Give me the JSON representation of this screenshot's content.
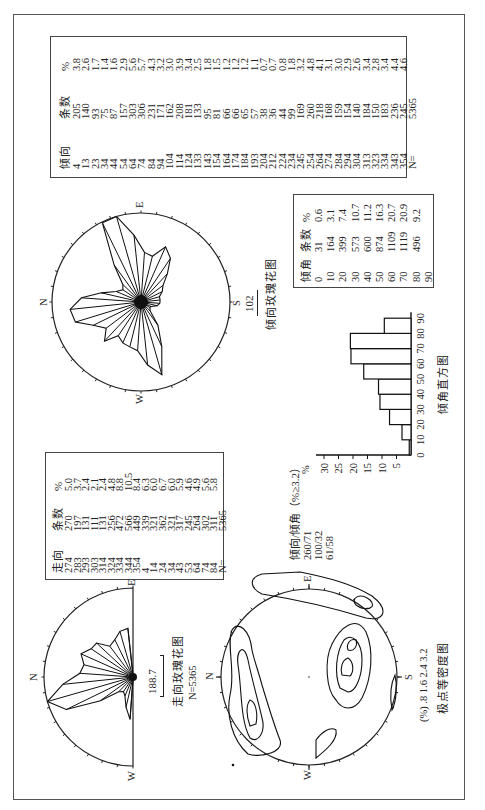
{
  "figure": {
    "dip_table": {
      "headers": [
        "倾向",
        "条数",
        "%"
      ],
      "dip_direction": [
        "4",
        "13",
        "23",
        "34",
        "44",
        "54",
        "64",
        "74",
        "84",
        "94",
        "104",
        "114",
        "124",
        "133",
        "143",
        "154",
        "164",
        "174",
        "184",
        "193",
        "204",
        "212",
        "224",
        "234",
        "245",
        "254",
        "264",
        "274",
        "284",
        "294",
        "304",
        "313",
        "323",
        "334",
        "343",
        "354",
        "N="
      ],
      "count": [
        "205",
        "140",
        "93",
        "75",
        "87",
        "157",
        "303",
        "306",
        "231",
        "171",
        "162",
        "208",
        "181",
        "133",
        "95",
        "81",
        "66",
        "66",
        "65",
        "57",
        "38",
        "36",
        "44",
        "99",
        "169",
        "260",
        "218",
        "168",
        "159",
        "154",
        "140",
        "184",
        "150",
        "183",
        "236",
        "245",
        "5365"
      ],
      "percent": [
        "3.8",
        "2.6",
        "1.7",
        "1.4",
        "1.6",
        "2.9",
        "5.6",
        "5.7",
        "4.3",
        "3.2",
        "3.0",
        "3.9",
        "3.4",
        "2.5",
        "1.8",
        "1.5",
        "1.2",
        "1.2",
        "1.2",
        "1.1",
        "0.7",
        "0.7",
        "0.8",
        "1.8",
        "3.2",
        "4.8",
        "4.1",
        "3.1",
        "3.0",
        "2.9",
        "2.6",
        "3.4",
        "2.8",
        "3.4",
        "4.4",
        "4.6"
      ]
    },
    "strike_table": {
      "headers": [
        "走向",
        "条数",
        "%"
      ],
      "strike": [
        "274",
        "283",
        "293",
        "303",
        "314",
        "324",
        "334",
        "344",
        "354",
        "4",
        "14",
        "24",
        "34",
        "43",
        "53",
        "64",
        "74",
        "84",
        "N="
      ],
      "count": [
        "270",
        "197",
        "131",
        "111",
        "131",
        "256",
        "472",
        "566",
        "449",
        "339",
        "321",
        "362",
        "321",
        "317",
        "245",
        "264",
        "302",
        "311",
        "5365"
      ],
      "percent": [
        "5.0",
        "3.7",
        "2.4",
        "2.1",
        "2.4",
        "4.8",
        "8.8",
        "10.5",
        "8.4",
        "6.3",
        "6.0",
        "6.7",
        "6.0",
        "5.9",
        "4.6",
        "4.9",
        "5.6",
        "5.8"
      ]
    },
    "dip_angle_table": {
      "headers": [
        "倾角",
        "条数",
        "%"
      ],
      "dip_angle": [
        "0",
        "10",
        "20",
        "30",
        "40",
        "50",
        "60",
        "70",
        "80",
        "90"
      ],
      "count": [
        "31",
        "164",
        "399",
        "573",
        "600",
        "874",
        "1109",
        "1119",
        "496"
      ],
      "percent": [
        "0.6",
        "3.1",
        "7.4",
        "10.7",
        "11.2",
        "16.3",
        "20.7",
        "20.9",
        "9.2"
      ]
    },
    "strike_rose": {
      "labels": {
        "n": "N",
        "e": "E",
        "w": "W"
      },
      "scale_value": "188.7",
      "caption": "走向玫瑰花图",
      "n_label": "N=5365"
    },
    "dip_rose": {
      "labels": {
        "n": "N",
        "e": "E",
        "s": "S",
        "w": "W"
      },
      "scale_value": "102",
      "caption": "倾向玫瑰花图"
    },
    "contour": {
      "labels": {
        "n": "N",
        "e": "E",
        "s": "S",
        "w": "W"
      },
      "title": "倾向/倾角（%≥3.2）",
      "maxima": [
        "260/71",
        "100/32",
        "61/58"
      ],
      "legend": "(%) .8 1.6 2.4 3.2",
      "caption": "极点等密度图"
    },
    "histogram": {
      "ylabel": "%",
      "yticks": [
        "5",
        "10",
        "15",
        "20",
        "25",
        "30"
      ],
      "xticks": [
        "0",
        "10",
        "20",
        "30",
        "40",
        "50",
        "60",
        "70",
        "80",
        "90"
      ],
      "caption": "倾角直方图"
    }
  },
  "chart_data": [
    {
      "type": "table",
      "title": "倾向统计",
      "columns": [
        "倾向",
        "条数",
        "%"
      ],
      "rows": [
        [
          4,
          205,
          3.8
        ],
        [
          13,
          140,
          2.6
        ],
        [
          23,
          93,
          1.7
        ],
        [
          34,
          75,
          1.4
        ],
        [
          44,
          87,
          1.6
        ],
        [
          54,
          157,
          2.9
        ],
        [
          64,
          303,
          5.6
        ],
        [
          74,
          306,
          5.7
        ],
        [
          84,
          231,
          4.3
        ],
        [
          94,
          171,
          3.2
        ],
        [
          104,
          162,
          3.0
        ],
        [
          114,
          208,
          3.9
        ],
        [
          124,
          181,
          3.4
        ],
        [
          133,
          133,
          2.5
        ],
        [
          143,
          95,
          1.8
        ],
        [
          154,
          81,
          1.5
        ],
        [
          164,
          66,
          1.2
        ],
        [
          174,
          66,
          1.2
        ],
        [
          184,
          65,
          1.2
        ],
        [
          193,
          57,
          1.1
        ],
        [
          204,
          38,
          0.7
        ],
        [
          212,
          36,
          0.7
        ],
        [
          224,
          44,
          0.8
        ],
        [
          234,
          99,
          1.8
        ],
        [
          245,
          169,
          3.2
        ],
        [
          254,
          260,
          4.8
        ],
        [
          264,
          218,
          4.1
        ],
        [
          274,
          168,
          3.1
        ],
        [
          284,
          159,
          3.0
        ],
        [
          294,
          154,
          2.9
        ],
        [
          304,
          140,
          2.6
        ],
        [
          313,
          184,
          3.4
        ],
        [
          323,
          150,
          2.8
        ],
        [
          334,
          183,
          3.4
        ],
        [
          343,
          236,
          4.4
        ],
        [
          354,
          245,
          4.6
        ]
      ],
      "total": 5365
    },
    {
      "type": "table",
      "title": "走向统计",
      "columns": [
        "走向",
        "条数",
        "%"
      ],
      "rows": [
        [
          274,
          270,
          5.0
        ],
        [
          283,
          197,
          3.7
        ],
        [
          293,
          131,
          2.4
        ],
        [
          303,
          111,
          2.1
        ],
        [
          314,
          131,
          2.4
        ],
        [
          324,
          256,
          4.8
        ],
        [
          334,
          472,
          8.8
        ],
        [
          344,
          566,
          10.5
        ],
        [
          354,
          449,
          8.4
        ],
        [
          4,
          339,
          6.3
        ],
        [
          14,
          321,
          6.0
        ],
        [
          24,
          362,
          6.7
        ],
        [
          34,
          321,
          6.0
        ],
        [
          43,
          317,
          5.9
        ],
        [
          53,
          245,
          4.6
        ],
        [
          64,
          264,
          4.9
        ],
        [
          74,
          302,
          5.6
        ],
        [
          84,
          311,
          5.8
        ]
      ],
      "total": 5365
    },
    {
      "type": "table",
      "title": "倾角统计",
      "columns": [
        "倾角",
        "条数",
        "%"
      ],
      "rows": [
        [
          10,
          31,
          0.6
        ],
        [
          20,
          164,
          3.1
        ],
        [
          30,
          399,
          7.4
        ],
        [
          40,
          573,
          10.7
        ],
        [
          50,
          600,
          11.2
        ],
        [
          60,
          874,
          16.3
        ],
        [
          70,
          1109,
          20.7
        ],
        [
          80,
          1119,
          20.9
        ],
        [
          90,
          496,
          9.2
        ]
      ]
    },
    {
      "type": "bar",
      "title": "倾角直方图",
      "categories": [
        "0-10",
        "10-20",
        "20-30",
        "30-40",
        "40-50",
        "50-60",
        "60-70",
        "70-80",
        "80-90"
      ],
      "values": [
        0.6,
        3.1,
        7.4,
        10.7,
        11.2,
        16.3,
        20.7,
        20.9,
        9.2
      ],
      "xlabel": "倾角",
      "ylabel": "%",
      "ylim": [
        0,
        32
      ],
      "yticks": [
        5,
        10,
        15,
        20,
        25,
        30
      ]
    },
    {
      "type": "rose",
      "title": "走向玫瑰花图",
      "directions": [
        274,
        283,
        293,
        303,
        314,
        324,
        334,
        344,
        354,
        4,
        14,
        24,
        34,
        43,
        53,
        64,
        74,
        84
      ],
      "values": [
        270,
        197,
        131,
        111,
        131,
        256,
        472,
        566,
        449,
        339,
        321,
        362,
        321,
        317,
        245,
        264,
        302,
        311
      ],
      "scale": 188.7,
      "n": 5365
    },
    {
      "type": "rose",
      "title": "倾向玫瑰花图",
      "directions": [
        4,
        13,
        23,
        34,
        44,
        54,
        64,
        74,
        84,
        94,
        104,
        114,
        124,
        133,
        143,
        154,
        164,
        174,
        184,
        193,
        204,
        212,
        224,
        234,
        245,
        254,
        264,
        274,
        284,
        294,
        304,
        313,
        323,
        334,
        343,
        354
      ],
      "values": [
        205,
        140,
        93,
        75,
        87,
        157,
        303,
        306,
        231,
        171,
        162,
        208,
        181,
        133,
        95,
        81,
        66,
        66,
        65,
        57,
        38,
        36,
        44,
        99,
        169,
        260,
        218,
        168,
        159,
        154,
        140,
        184,
        150,
        183,
        236,
        245
      ],
      "scale": 102
    },
    {
      "type": "contour",
      "title": "极点等密度图 倾向/倾角（%≥3.2）",
      "contour_levels": [
        0.8,
        1.6,
        2.4,
        3.2
      ],
      "maxima": [
        "260/71",
        "100/32",
        "61/58"
      ]
    }
  ]
}
